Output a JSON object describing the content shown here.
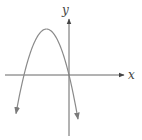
{
  "chart_data": {
    "type": "line",
    "title": "",
    "xlabel": "x",
    "ylabel": "y",
    "series": [
      {
        "name": "parabola",
        "shape": "concave-down parabola",
        "x_intercepts_px": [
          24,
          69
        ],
        "vertex_px": [
          46.5,
          29
        ],
        "left_end_px": [
          16,
          119
        ],
        "right_end_px": [
          78,
          119
        ]
      }
    ],
    "axes": {
      "origin_px": [
        69,
        75
      ],
      "x_axis": {
        "from_px": 5,
        "to_px": 124,
        "arrow": "right"
      },
      "y_axis": {
        "from_px": 136,
        "to_px": 19,
        "arrow": "up"
      }
    },
    "grid": false,
    "legend": null,
    "colors": {
      "axis": "#555555",
      "curve": "#8a8a8a",
      "label": "#444444"
    }
  },
  "labels": {
    "x": "x",
    "y": "y"
  }
}
